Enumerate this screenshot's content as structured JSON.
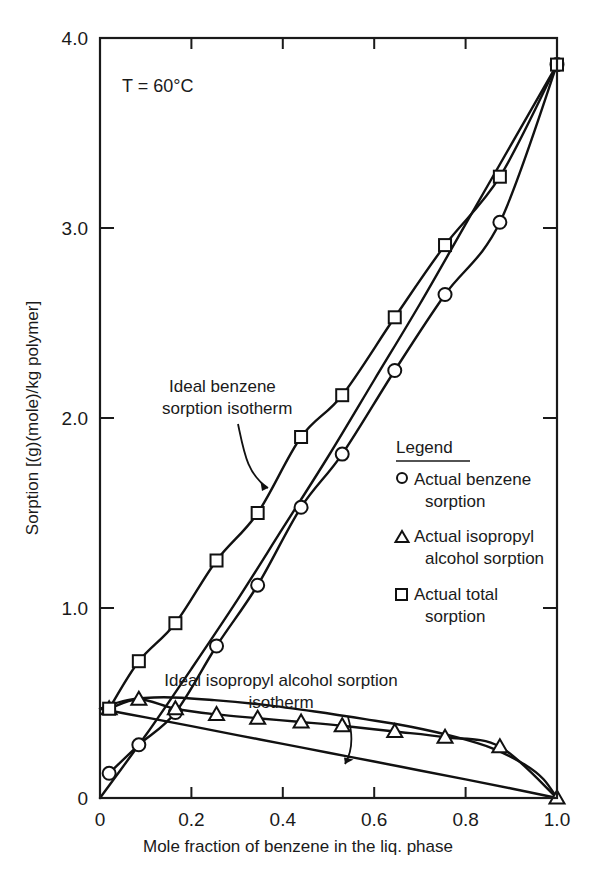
{
  "figure": {
    "condition_label": "T = 60°C",
    "background": "#ffffff",
    "ink": "#111111"
  },
  "annotations": [
    {
      "id": "ideal-benzene",
      "line1": "Ideal benzene",
      "line2": "sorption isotherm"
    },
    {
      "id": "ideal-ipa",
      "line1": "Ideal isopropyl alcohol sorption",
      "line2": "isotherm"
    }
  ],
  "legend": {
    "title": "Legend",
    "items": [
      {
        "marker": "circle-marker",
        "line1": "Actual benzene",
        "line2": "sorption"
      },
      {
        "marker": "triangle-marker",
        "line1": "Actual isopropyl",
        "line2": "alcohol sorption"
      },
      {
        "marker": "square-marker",
        "line1": "Actual total",
        "line2": "sorption"
      }
    ]
  },
  "chart_data": {
    "type": "scatter",
    "title": "",
    "xlabel": "Mole fraction of benzene in the liq. phase",
    "ylabel": "Sorption [(g)(mole)/kg polymer]",
    "xlim": [
      0,
      1.0
    ],
    "ylim": [
      0,
      4.0
    ],
    "xticks": [
      0,
      0.2,
      0.4,
      0.6,
      0.8,
      1.0
    ],
    "xtick_labels": [
      "0",
      "0.2",
      "0.4",
      "0.6",
      "0.8",
      "1.0"
    ],
    "yticks": [
      0,
      1.0,
      2.0,
      3.0,
      4.0
    ],
    "ytick_labels": [
      "0",
      "1.0",
      "2.0",
      "3.0",
      "4.0"
    ],
    "grid": false,
    "legend_position": "inside-right",
    "series": [
      {
        "name": "Actual benzene sorption",
        "marker": "circle",
        "x": [
          0.02,
          0.085,
          0.165,
          0.255,
          0.345,
          0.44,
          0.53,
          0.645,
          0.755,
          0.875,
          1.0
        ],
        "y": [
          0.13,
          0.28,
          0.45,
          0.8,
          1.12,
          1.53,
          1.81,
          2.25,
          2.65,
          3.03,
          3.86
        ]
      },
      {
        "name": "Actual isopropyl alcohol sorption",
        "marker": "triangle",
        "x": [
          0.02,
          0.085,
          0.165,
          0.255,
          0.345,
          0.44,
          0.53,
          0.645,
          0.755,
          0.875,
          1.0
        ],
        "y": [
          0.47,
          0.52,
          0.47,
          0.44,
          0.42,
          0.4,
          0.38,
          0.35,
          0.32,
          0.27,
          0.0
        ]
      },
      {
        "name": "Actual total sorption",
        "marker": "square",
        "x": [
          0.02,
          0.085,
          0.165,
          0.255,
          0.345,
          0.44,
          0.53,
          0.645,
          0.755,
          0.875,
          1.0
        ],
        "y": [
          0.47,
          0.72,
          0.92,
          1.25,
          1.5,
          1.9,
          2.12,
          2.53,
          2.91,
          3.27,
          3.86
        ]
      },
      {
        "name": "Ideal benzene sorption isotherm",
        "marker": "none",
        "x": [
          0.0,
          0.1,
          0.2,
          0.3,
          0.4,
          0.5,
          0.6,
          0.7,
          0.8,
          0.9,
          1.0
        ],
        "y": [
          0.0,
          0.33,
          0.68,
          1.04,
          1.42,
          1.8,
          2.2,
          2.6,
          3.02,
          3.44,
          3.86
        ]
      },
      {
        "name": "Ideal isopropyl alcohol sorption isotherm",
        "marker": "none",
        "x": [
          0.0,
          0.1,
          0.2,
          0.3,
          0.4,
          0.5,
          0.6,
          0.7,
          0.8,
          0.9,
          1.0
        ],
        "y": [
          0.47,
          0.424,
          0.378,
          0.331,
          0.285,
          0.238,
          0.192,
          0.145,
          0.098,
          0.05,
          0.0
        ]
      },
      {
        "name": "Actual isopropyl alcohol sorption curve",
        "marker": "none",
        "x": [
          0.0,
          0.06,
          0.14,
          0.25,
          0.36,
          0.47,
          0.58,
          0.68,
          0.78,
          0.86,
          0.93,
          0.97,
          1.0
        ],
        "y": [
          0.47,
          0.515,
          0.53,
          0.515,
          0.49,
          0.455,
          0.415,
          0.375,
          0.32,
          0.26,
          0.175,
          0.1,
          0.0
        ]
      }
    ]
  }
}
